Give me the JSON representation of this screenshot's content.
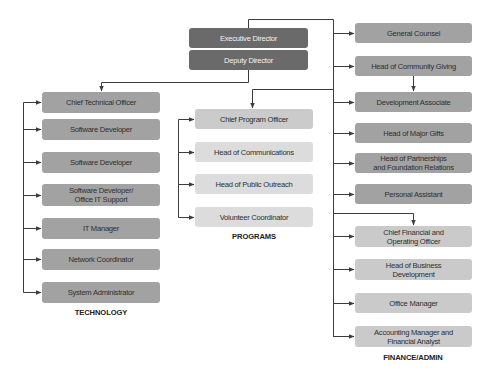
{
  "colors": {
    "executive": "#6a6a6a",
    "department_box": "#a2a2a2",
    "program_lead": "#cbcbcb",
    "program_box": "#dcdcdc",
    "finance_box": "#cacaca",
    "connector": "#3c3c3c"
  },
  "leadership": {
    "executive_director": "Executive Director",
    "deputy_director": "Deputy Director"
  },
  "technology": {
    "label": "TECHNOLOGY",
    "items": [
      "Chief Technical Officer",
      "Software Developer",
      "Software Developer",
      "Software Developer/\nOffice IT Support",
      "IT Manager",
      "Network Coordinator",
      "System Administrator"
    ]
  },
  "programs": {
    "label": "PROGRAMS",
    "items": [
      "Chief Program Officer",
      "Head of Communications",
      "Head of Public Outreach",
      "Volunteer Coordinator"
    ]
  },
  "executive_staff": {
    "items": [
      "General Counsel",
      "Head of Community Giving",
      "Development Associate",
      "Head of Major Gifts",
      "Head of Partnerships\nand Foundation Relations",
      "Personal Assistant"
    ]
  },
  "finance_admin": {
    "label": "FINANCE/ADMIN",
    "items": [
      "Chief Financial and\nOperating Officer",
      "Head of Business\nDevelopment",
      "Office Manager",
      "Accounting Manager and\nFinancial Analyst"
    ]
  }
}
